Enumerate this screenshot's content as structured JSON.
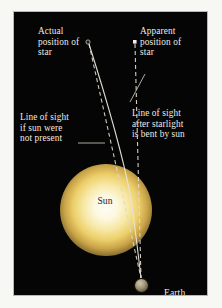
{
  "figure": {
    "background_color": "#050505",
    "paper_color": "#f7f7f4",
    "text_color": "#efece4",
    "frame_color": "#b9b7b0"
  },
  "labels": {
    "actual_position": "Actual\nposition of\nstar",
    "apparent_position": "Apparent\nposition of\nstar",
    "line_no_sun": "Line of sight\nif sun were\nnot present",
    "line_bent": "Line of sight\nafter starlight\nis bent by sun",
    "sun": "Sun",
    "earth": "Earth"
  },
  "objects": {
    "sun": {
      "name": "sun",
      "center_x": 92,
      "center_y": 198,
      "radius": 46,
      "core_color": "#fffdf4",
      "mid_color": "#eccf6a",
      "edge_color": "#241d0c"
    },
    "earth": {
      "name": "earth",
      "center_x": 127,
      "center_y": 273,
      "radius": 6.5,
      "color": "#a89b7d"
    },
    "actual_star": {
      "name": "actual-star-marker",
      "x": 74,
      "y": 30,
      "shape": "circle",
      "color": "#b9b4a6"
    },
    "apparent_star": {
      "name": "apparent-star-marker",
      "x": 121,
      "y": 30,
      "shape": "square",
      "color": "#f2efe6"
    }
  },
  "rays": {
    "bent_light_ray": {
      "name": "bent-light-ray",
      "style": "solid",
      "color": "#e8e4d8",
      "width": 1.1,
      "path": "M 75,32 C 95,95 110,150 116,182 C 120,206 123,232 127,266"
    },
    "straight_sight_line": {
      "name": "straight-line-of-sight",
      "style": "dashed",
      "color": "#ded9cc",
      "width": 1.1,
      "dash": "4,3",
      "path": "M 75,32 L 127,266"
    },
    "apparent_sight_line": {
      "name": "apparent-line-of-sight",
      "style": "dashed",
      "color": "#ded9cc",
      "width": 1.1,
      "dash": "4,3",
      "path": "M 121,32 L 127,266"
    }
  },
  "leaders": {
    "left_leader": {
      "name": "leader-line-no-sun",
      "color": "#d8d3c6",
      "path": "M 64,131 L 91,131"
    },
    "right_leader": {
      "name": "leader-line-bent",
      "color": "#d8d3c6",
      "path": "M 116,90 L 131,62"
    }
  }
}
